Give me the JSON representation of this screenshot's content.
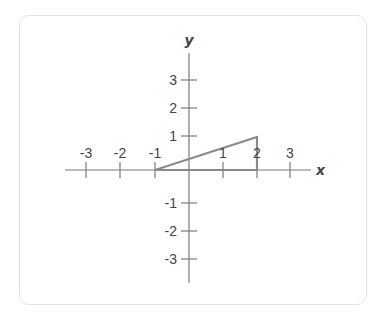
{
  "diagram": {
    "type": "coordinate-plane",
    "x_axis_label": "x",
    "y_axis_label": "y",
    "x_ticks": [
      "-3",
      "-2",
      "-1",
      "1",
      "2",
      "3"
    ],
    "y_ticks": [
      "3",
      "2",
      "1",
      "-1",
      "-2",
      "-3"
    ],
    "shape": {
      "type": "triangle",
      "vertices": [
        [
          -1,
          0
        ],
        [
          2,
          0
        ],
        [
          2,
          1
        ]
      ]
    },
    "colors": {
      "axis": "#7a7a7a",
      "shape": "#8a8a8a",
      "text": "#444444",
      "card_border": "#e4e4e4"
    }
  }
}
